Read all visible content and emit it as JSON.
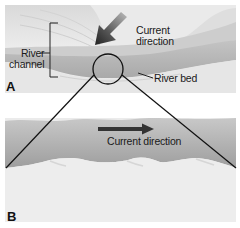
{
  "figure": {
    "panel_a": {
      "letter": "A",
      "labels": {
        "river_channel_line1": "River",
        "river_channel_line2": "channel",
        "current_line1": "Current",
        "current_line2": "direction",
        "river_bed": "River bed"
      }
    },
    "panel_b": {
      "letter": "B",
      "labels": {
        "current_direction": "Current direction"
      }
    },
    "colors": {
      "hill": "#e4e4e4",
      "hill_shade": "#d2d2d2",
      "channel": "#b9b9b9",
      "water_b": "#a9a9a9",
      "sand": "#ececec",
      "arrow": "#333333",
      "line": "#111111"
    }
  }
}
